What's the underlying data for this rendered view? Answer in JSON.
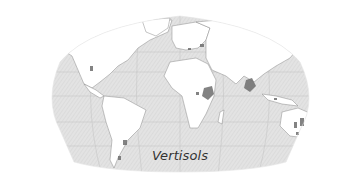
{
  "map": {
    "title": "Vertisols",
    "projection": "Robinson-like world projection",
    "colors": {
      "ocean": "#e2e2e2",
      "ocean_hatch": "#d2d2d2",
      "land": "#ffffff",
      "border": "#8a8a8a",
      "graticule": "#c4c4c4",
      "vertisol": "#6e6e6e",
      "caption": "#333333"
    },
    "highlighted_regions": [
      "Eastern Africa (Sudan/Ethiopia)",
      "India (Deccan)",
      "Eastern Australia",
      "Texas / Gulf Coast",
      "Argentina / Uruguay",
      "Eastern Europe / Black Sea"
    ]
  }
}
